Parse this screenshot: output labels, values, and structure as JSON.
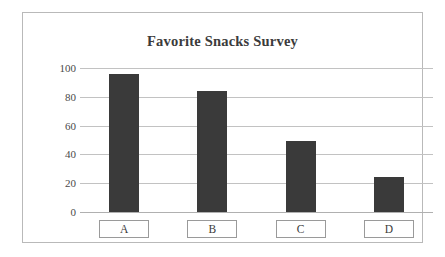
{
  "chart_data": {
    "type": "bar",
    "title": "Favorite Snacks Survey",
    "categories": [
      "A",
      "B",
      "C",
      "D"
    ],
    "values": [
      96,
      84,
      49,
      24
    ],
    "xlabel": "",
    "ylabel": "",
    "ylim": [
      0,
      100
    ],
    "yticks": [
      0,
      20,
      40,
      60,
      80,
      100
    ],
    "ytick_labels": [
      "0",
      "20",
      "40",
      "60",
      "80",
      "100"
    ],
    "grid": true,
    "legend": false,
    "bar_color": "#3a3a3a",
    "gridline_color": "#c2c2c2",
    "frame_color": "#b9b9b9",
    "background_color": "#ffffff"
  }
}
